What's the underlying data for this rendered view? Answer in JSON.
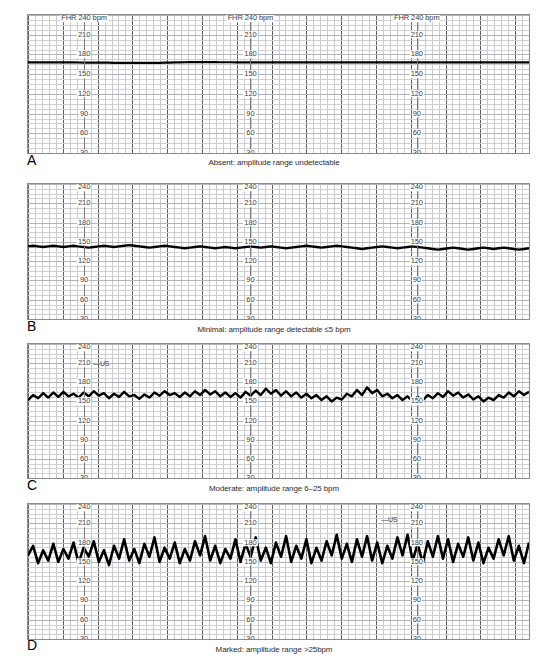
{
  "figure": {
    "axis_unit": "bpm",
    "tick_values": [
      240,
      210,
      180,
      150,
      120,
      90,
      60,
      30
    ],
    "top_tick_label_a": "FHR 240 bpm",
    "top_tick_label_other": "240",
    "us_marker": "—US",
    "grid_color": "#c9c9cf",
    "grid_bold_color": "#5d5d66",
    "trace_color": "#000000"
  },
  "panels": [
    {
      "letter": "A",
      "caption": "Absent: amplitude range undetectable",
      "top_label_style": "fhr",
      "us_markers": [],
      "chart_data": {
        "type": "line",
        "title": "Absent: amplitude range undetectable",
        "xlabel": "",
        "ylabel": "FHR (bpm)",
        "ylim": [
          30,
          240
        ],
        "baseline_bpm": 168,
        "amplitude_bpm": 0,
        "variability_category": "absent",
        "series": [
          {
            "name": "FHR",
            "values": [
              168,
              168,
              168,
              168,
              168,
              168,
              168,
              168,
              168,
              167.8,
              167.7,
              167.6,
              167.6,
              167.5,
              167.5,
              167.4,
              167.4,
              167.3,
              167.3,
              167.2,
              167.2,
              167.2,
              167.1,
              167.1,
              167.1,
              167.2,
              167.3,
              167.4,
              167.6,
              167.8,
              168,
              168.1,
              168.2,
              168.2,
              168.2,
              168.2,
              168.2,
              168.2,
              168.1,
              168.1,
              168.1,
              168,
              168,
              168,
              168,
              168,
              168,
              168,
              168,
              168,
              168,
              168,
              168,
              168,
              168,
              168,
              168,
              168,
              168,
              168,
              168,
              168,
              168,
              168,
              168,
              168,
              168,
              168,
              168,
              168,
              168,
              168,
              168,
              168,
              168,
              168,
              168,
              168,
              168,
              168,
              168,
              168,
              168,
              168,
              168,
              168,
              168,
              168,
              168,
              168,
              168,
              168,
              168,
              168,
              168,
              168,
              168,
              168,
              168,
              168
            ]
          }
        ]
      }
    },
    {
      "letter": "B",
      "caption": "Minimal: amplitude range detectable ≤5 bpm",
      "top_label_style": "plain",
      "us_markers": [],
      "chart_data": {
        "type": "line",
        "title": "Minimal: amplitude range detectable ≤5 bpm",
        "xlabel": "",
        "ylabel": "FHR (bpm)",
        "ylim": [
          30,
          240
        ],
        "baseline_bpm": 142,
        "amplitude_bpm": 4,
        "variability_category": "minimal",
        "series": [
          {
            "name": "FHR",
            "values": [
              143,
              144,
              143,
              142,
              143,
              144,
              143,
              142,
              143,
              144,
              143,
              142,
              141,
              142,
              143,
              144,
              143,
              142,
              143,
              144,
              145,
              144,
              143,
              142,
              141,
              142,
              143,
              144,
              143,
              142,
              141,
              140,
              141,
              142,
              143,
              142,
              141,
              140,
              141,
              142,
              141,
              140,
              141,
              142,
              143,
              142,
              141,
              142,
              143,
              142,
              141,
              140,
              141,
              142,
              143,
              144,
              143,
              142,
              141,
              142,
              143,
              144,
              143,
              142,
              141,
              140,
              139,
              140,
              141,
              142,
              143,
              142,
              141,
              140,
              141,
              142,
              143,
              142,
              141,
              140,
              139,
              138,
              139,
              140,
              141,
              140,
              139,
              138,
              139,
              140,
              141,
              140,
              139,
              140,
              141,
              140,
              139,
              138,
              139,
              140
            ]
          }
        ]
      }
    },
    {
      "letter": "C",
      "caption": "Moderate: amplitude range 6–25 bpm",
      "top_label_style": "plain",
      "us_markers": [
        {
          "label": "—US",
          "x_pct": 13.0,
          "y_pct": 12.0
        }
      ],
      "chart_data": {
        "type": "line",
        "title": "Moderate: amplitude range 6–25 bpm",
        "xlabel": "",
        "ylabel": "FHR (bpm)",
        "ylim": [
          30,
          240
        ],
        "baseline_bpm": 158,
        "amplitude_bpm": 15,
        "variability_category": "moderate",
        "series": [
          {
            "name": "FHR",
            "values": [
              152,
              160,
              155,
              163,
              156,
              164,
              157,
              165,
              158,
              162,
              156,
              164,
              158,
              166,
              159,
              163,
              155,
              162,
              157,
              165,
              158,
              160,
              154,
              161,
              156,
              164,
              159,
              166,
              160,
              163,
              157,
              164,
              158,
              166,
              160,
              168,
              161,
              166,
              158,
              164,
              157,
              163,
              156,
              165,
              159,
              167,
              160,
              170,
              162,
              168,
              159,
              166,
              158,
              164,
              156,
              162,
              155,
              160,
              152,
              158,
              150,
              156,
              153,
              162,
              158,
              168,
              160,
              172,
              163,
              168,
              158,
              162,
              155,
              160,
              152,
              158,
              150,
              157,
              152,
              160,
              155,
              163,
              157,
              166,
              159,
              164,
              156,
              161,
              153,
              158,
              150,
              156,
              152,
              160,
              156,
              164,
              158,
              166,
              160,
              165
            ]
          }
        ]
      }
    },
    {
      "letter": "D",
      "caption": "Marked: amplitude range >25bpm",
      "top_label_style": "plain",
      "us_markers": [
        {
          "label": "—US",
          "x_pct": 70.5,
          "y_pct": 9.0
        }
      ],
      "chart_data": {
        "type": "line",
        "title": "Marked: amplitude range >25bpm",
        "xlabel": "",
        "ylabel": "FHR (bpm)",
        "ylim": [
          30,
          240
        ],
        "baseline_bpm": 163,
        "amplitude_bpm": 32,
        "variability_category": "marked",
        "series": [
          {
            "name": "FHR",
            "values": [
              160,
              175,
              148,
              168,
              152,
              178,
              150,
              170,
              155,
              180,
              148,
              172,
              158,
              182,
              150,
              168,
              145,
              175,
              155,
              185,
              152,
              170,
              148,
              178,
              158,
              188,
              150,
              172,
              155,
              180,
              148,
              170,
              152,
              182,
              160,
              190,
              152,
              175,
              148,
              170,
              155,
              185,
              150,
              178,
              158,
              188,
              152,
              172,
              148,
              180,
              158,
              190,
              150,
              175,
              155,
              185,
              148,
              172,
              152,
              182,
              160,
              192,
              155,
              178,
              150,
              185,
              158,
              190,
              152,
              180,
              148,
              175,
              155,
              188,
              160,
              192,
              152,
              178,
              148,
              182,
              158,
              190,
              155,
              185,
              150,
              178,
              158,
              188,
              152,
              180,
              148,
              172,
              155,
              185,
              160,
              190,
              152,
              175,
              148,
              180
            ]
          }
        ]
      }
    }
  ]
}
